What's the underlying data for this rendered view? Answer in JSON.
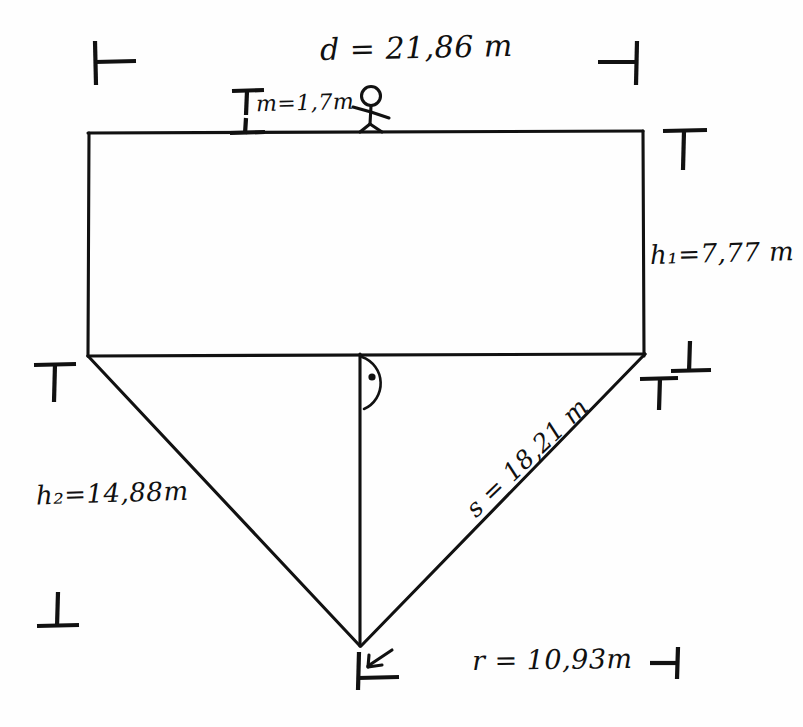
{
  "document": {
    "title": "Hand-drawn geometry sketch",
    "medium": "black pen on white paper",
    "ink_color": "#111111",
    "paper_color": "#fefefe"
  },
  "labels": {
    "top_width": {
      "symbol": "d",
      "equals": "=",
      "value": "21,86",
      "unit": "m",
      "text": "d = 21,86 m"
    },
    "person_height": {
      "symbol": "m",
      "equals": "=",
      "value": "1,7",
      "unit": "m",
      "text": "m=1,7m"
    },
    "right_height": {
      "symbol": "h",
      "subscript": "1",
      "equals": "=",
      "value": "7,77",
      "unit": "m",
      "text": "h₁=7,77 m"
    },
    "left_height": {
      "symbol": "h",
      "subscript": "2",
      "equals": "=",
      "value": "14,88",
      "unit": "m",
      "text": "h₂=14,88m"
    },
    "slant_side": {
      "symbol": "s",
      "equals": "=",
      "value": "18,21",
      "unit": "m",
      "text": "s = 18,21 m"
    },
    "radius": {
      "symbol": "r",
      "equals": "=",
      "value": "10,93",
      "unit": "m",
      "text": "r = 10,93m"
    }
  },
  "figure": {
    "shapes": [
      {
        "name": "rectangle",
        "corners": [
          [
            88,
            133
          ],
          [
            643,
            133
          ],
          [
            643,
            355
          ],
          [
            88,
            355
          ]
        ]
      },
      {
        "name": "triangle",
        "corners": [
          [
            88,
            355
          ],
          [
            643,
            355
          ],
          [
            360,
            645
          ]
        ]
      },
      {
        "name": "altitude",
        "from": [
          360,
          355
        ],
        "to": [
          360,
          645
        ]
      }
    ],
    "right_angle_marker": {
      "at": [
        360,
        355
      ],
      "style": "arc-with-dot"
    },
    "stick_figure": {
      "at": [
        370,
        120
      ],
      "pose": "standing-walking",
      "stands_on": "top-edge"
    }
  },
  "marks": {
    "crop_top_left": {
      "glyph": "⊢",
      "at": [
        95,
        62
      ]
    },
    "crop_top_right": {
      "glyph": "⊣",
      "at": [
        635,
        62
      ]
    },
    "tick_left_mid": {
      "glyph": "⊤",
      "at": [
        50,
        368
      ]
    },
    "tick_right_corner": {
      "glyph": "⊤",
      "at": [
        683,
        140
      ]
    },
    "tick_right_mid_upper": {
      "glyph": "⊥",
      "at": [
        690,
        356
      ]
    },
    "tick_right_mid_lower": {
      "glyph": "⊤",
      "at": [
        661,
        382
      ]
    },
    "tick_bottom_left": {
      "glyph": "⊥",
      "at": [
        57,
        614
      ]
    },
    "tick_apex": {
      "glyph": "⊢",
      "at": [
        368,
        672
      ]
    },
    "tick_radius_end": {
      "glyph": "⊣",
      "at": [
        660,
        658
      ]
    },
    "arrow_at_apex": {
      "glyph": "arrow",
      "at": [
        385,
        660
      ]
    },
    "height_tick_top": {
      "glyph": "⊤",
      "at": [
        245,
        96
      ]
    },
    "height_tick_bottom": {
      "glyph": "⊥",
      "at": [
        245,
        130
      ]
    }
  }
}
